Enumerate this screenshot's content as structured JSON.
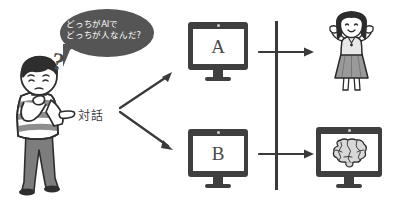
{
  "scene": {
    "title": "AIと人の対話（チューリングテスト）イラスト",
    "background_color": "#ffffff",
    "width": 394,
    "height": 201
  },
  "speech_bubble": {
    "text": "どっちがAIで\nどっちが人なんだ?",
    "line1": "どっちがAIで",
    "line2": "どっちが人なんだ?",
    "fill_color": "#555555",
    "text_color": "#ffffff"
  },
  "man": {
    "name": "questioning-man",
    "question_mark": "?",
    "hair_color": "#2e2e2e",
    "shirt": "striped",
    "shirt_color": "#8c8c8c",
    "pants_color": "#6e6e6e",
    "skin_color": "#f2f2f2"
  },
  "labels": {
    "dialogue": "対話"
  },
  "monitors": [
    {
      "id": "a",
      "letter": "A",
      "bezel_color": "#3f3f3f",
      "screen_color": "#ffffff"
    },
    {
      "id": "b",
      "letter": "B",
      "bezel_color": "#3f3f3f",
      "screen_color": "#ffffff"
    }
  ],
  "monitor_a": {
    "letter": "A"
  },
  "monitor_b": {
    "letter": "B"
  },
  "monitor_brain": {
    "content": "brain-illustration",
    "bezel_color": "#3f3f3f"
  },
  "woman": {
    "name": "cheering-woman",
    "hair_color": "#2b2b2b",
    "top_color": "#e0e0e0",
    "skirt_color": "#9a9a9a"
  },
  "connectors": {
    "arrow_to_a": "arrow-up-right",
    "arrow_to_b": "arrow-down-right",
    "divider": "vertical-divider-line",
    "arrow_top_right": "arrow-right",
    "arrow_bottom_right": "arrow-right",
    "line_color": "#3a3a3a"
  }
}
